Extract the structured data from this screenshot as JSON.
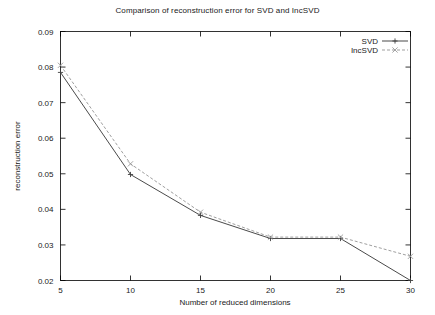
{
  "chart_data": {
    "type": "line",
    "title": "Comparison of reconstruction error for SVD and IncSVD",
    "xlabel": "Number of reduced dimensions",
    "ylabel": "reconstruction error",
    "x": [
      5,
      10,
      15,
      20,
      25,
      30
    ],
    "xticklabels": [
      "5",
      "10",
      "15",
      "20",
      "25",
      "30"
    ],
    "yticklabels": [
      "0.02",
      "0.03",
      "0.04",
      "0.05",
      "0.06",
      "0.07",
      "0.08",
      "0.09"
    ],
    "yticks": [
      0.02,
      0.03,
      0.04,
      0.05,
      0.06,
      0.07,
      0.08,
      0.09
    ],
    "xlim": [
      5,
      30
    ],
    "ylim": [
      0.02,
      0.09
    ],
    "grid": false,
    "legend_position": "top-right",
    "series": [
      {
        "name": "SVD",
        "values": [
          0.0785,
          0.0498,
          0.0383,
          0.0318,
          0.0318,
          0.02
        ],
        "color": "#404040",
        "dash": "none",
        "marker": "plus"
      },
      {
        "name": "IncSVD",
        "values": [
          0.0805,
          0.0528,
          0.0392,
          0.0322,
          0.0322,
          0.0268
        ],
        "color": "#9a9a9a",
        "dash": "dashed",
        "marker": "cross"
      }
    ]
  },
  "legend": {
    "entries": [
      {
        "label": "SVD"
      },
      {
        "label": "IncSVD"
      }
    ]
  }
}
